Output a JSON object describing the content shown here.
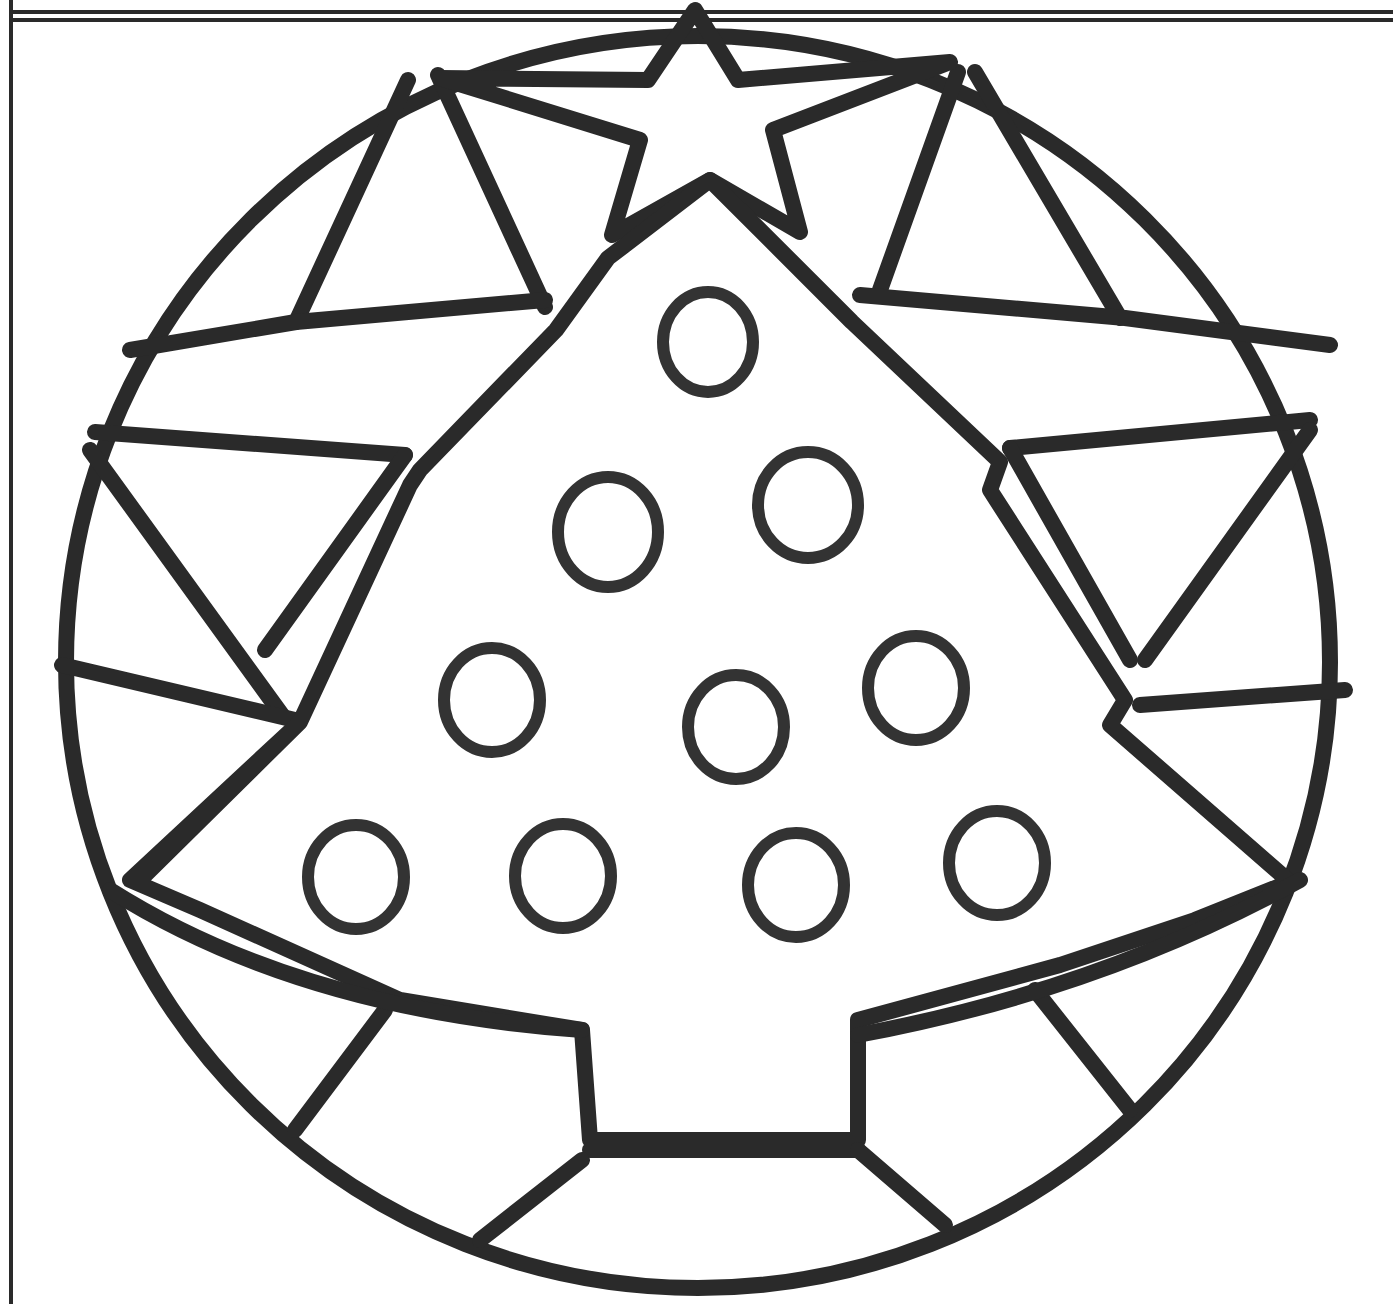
{
  "page": {
    "title": "Christmas tree mandala coloring page",
    "background_color": "#ffffff",
    "line_color": "#2a2a2a"
  },
  "artwork": {
    "frame": {
      "top_border": "double-line",
      "left_border": "single-line"
    },
    "outer_circle": {
      "cx": 698,
      "cy": 662,
      "r": 628
    },
    "star": {
      "points": 5
    },
    "tree": {
      "tiers": 4,
      "trunk": true
    },
    "ornaments": [
      {
        "cx": 708,
        "cy": 342
      },
      {
        "cx": 608,
        "cy": 532
      },
      {
        "cx": 808,
        "cy": 505
      },
      {
        "cx": 492,
        "cy": 700
      },
      {
        "cx": 736,
        "cy": 727
      },
      {
        "cx": 916,
        "cy": 688
      },
      {
        "cx": 356,
        "cy": 877
      },
      {
        "cx": 563,
        "cy": 876
      },
      {
        "cx": 796,
        "cy": 885
      },
      {
        "cx": 997,
        "cy": 863
      }
    ],
    "ornament_count": "10"
  }
}
